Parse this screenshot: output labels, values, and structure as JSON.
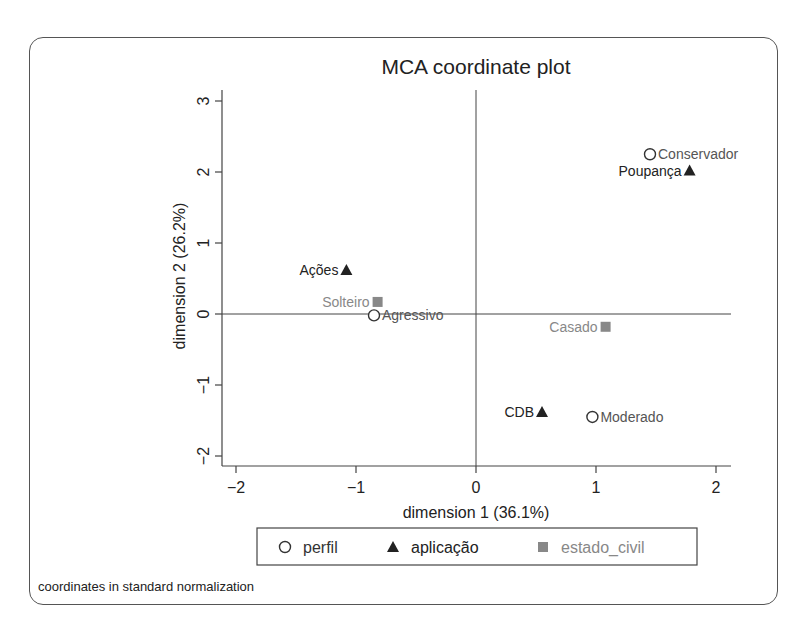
{
  "chart_data": {
    "type": "scatter",
    "title": "MCA coordinate plot",
    "xlabel": "dimension 1 (36.1%)",
    "ylabel": "dimension 2 (26.2%)",
    "xlim": [
      -2.1,
      2.1
    ],
    "ylim": [
      -2.1,
      3.2
    ],
    "xticks": [
      -2,
      -1,
      0,
      1,
      2
    ],
    "yticks": [
      -2,
      -1,
      0,
      1,
      2,
      3
    ],
    "xtick_labels": [
      "−2",
      "−1",
      "0",
      "1",
      "2"
    ],
    "ytick_labels": [
      "−2",
      "−1",
      "0",
      "1",
      "2",
      "3"
    ],
    "grid": false,
    "reference_lines": {
      "x": 0,
      "y": 0
    },
    "legend_position": "bottom",
    "series": [
      {
        "name": "perfil",
        "marker": "hollow-circle",
        "color": "#333333",
        "label_color": "#555555",
        "points": [
          {
            "label": "Conservador",
            "x": 1.45,
            "y": 2.25
          },
          {
            "label": "Agressivo",
            "x": -0.85,
            "y": -0.02
          },
          {
            "label": "Moderado",
            "x": 0.97,
            "y": -1.45
          }
        ]
      },
      {
        "name": "aplicação",
        "marker": "filled-triangle",
        "color": "#222222",
        "label_color": "#222222",
        "points": [
          {
            "label": "Poupança",
            "x": 1.78,
            "y": 2.02
          },
          {
            "label": "Ações",
            "x": -1.08,
            "y": 0.62
          },
          {
            "label": "CDB",
            "x": 0.55,
            "y": -1.38
          }
        ]
      },
      {
        "name": "estado_civil",
        "marker": "filled-square",
        "color": "#888888",
        "label_color": "#888888",
        "points": [
          {
            "label": "Solteiro",
            "x": -0.82,
            "y": 0.17
          },
          {
            "label": "Casado",
            "x": 1.08,
            "y": -0.18
          }
        ]
      }
    ],
    "note": "coordinates in standard normalization"
  }
}
